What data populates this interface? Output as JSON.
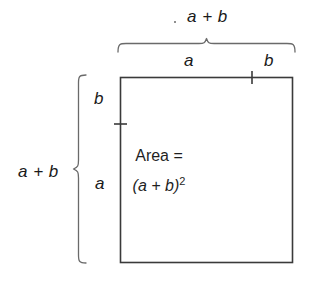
{
  "figure": {
    "background_color": "#ffffff",
    "stroke_color": "#3a3a3a",
    "text_color": "#1a1a1a"
  },
  "labels": {
    "top_total": "a + b",
    "top_segment_a": "a",
    "top_segment_b": "b",
    "left_total": "a + b",
    "left_segment_b": "b",
    "left_segment_a": "a",
    "area_word": "Area =",
    "area_expression_base": "(a + b)",
    "area_expression_exponent": "2"
  },
  "geometry": {
    "square_left": 120,
    "square_top": 77,
    "square_right": 293,
    "square_bottom": 263,
    "top_tick_x": 252,
    "left_tick_y": 124,
    "top_brace_left": 118,
    "top_brace_right": 295,
    "top_brace_y": 44,
    "left_brace_top": 75,
    "left_brace_bottom": 263,
    "left_brace_x": 79
  }
}
